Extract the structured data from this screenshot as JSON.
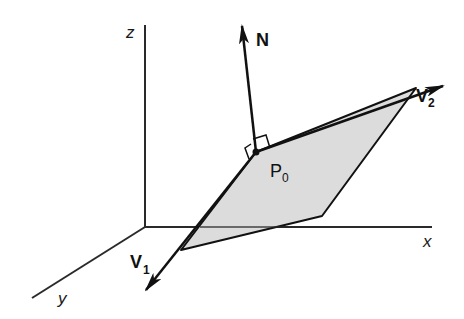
{
  "diagram": {
    "title": "",
    "axes": {
      "z": {
        "label": "z"
      },
      "x": {
        "label": "x"
      },
      "y": {
        "label": "y"
      }
    },
    "vectors": {
      "normal": {
        "label": "N",
        "subscript": ""
      },
      "v1": {
        "label": "V",
        "subscript": "1"
      },
      "v2": {
        "label": "V",
        "subscript": "2"
      }
    },
    "point": {
      "label": "P",
      "subscript": "0"
    },
    "plane": {
      "fill": "#dcdcdc",
      "description": "parallelogram plane spanned by V1 and V2 through P0"
    },
    "colors": {
      "line": "#111111",
      "axis": "#2a2a2a",
      "plane_fill": "#dcdcdc",
      "background": "#ffffff"
    }
  }
}
